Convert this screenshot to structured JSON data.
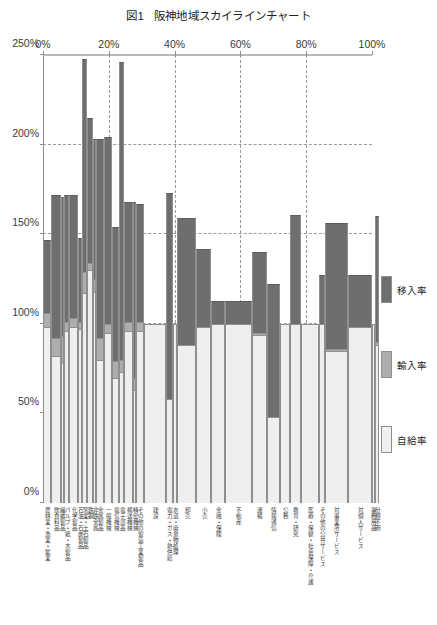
{
  "figure": {
    "number": "図1",
    "title": "阪神地域スカイラインチャート"
  },
  "legend": {
    "position": "right",
    "items": [
      {
        "key": "transfer",
        "label": "移入率",
        "color": "#6e6e6e"
      },
      {
        "key": "import",
        "label": "輸入率",
        "color": "#adadad"
      },
      {
        "key": "self",
        "label": "自給率",
        "color": "#efefef"
      }
    ]
  },
  "axes": {
    "x": {
      "label": "",
      "position": "top",
      "unit": "%",
      "min": 0,
      "max": 100,
      "ticks": [
        0,
        20,
        40,
        60,
        80,
        100
      ],
      "tick_labels": [
        "0%",
        "20%",
        "40%",
        "60%",
        "80%",
        "100%"
      ]
    },
    "y": {
      "label": "",
      "unit": "%",
      "min": 0,
      "max": 250,
      "ticks": [
        0,
        50,
        100,
        150,
        200,
        250
      ],
      "tick_labels": [
        "0%",
        "50%",
        "100%",
        "150%",
        "200%",
        "250%"
      ]
    }
  },
  "chart_data": {
    "type": "bar",
    "variant": "skyline-chart",
    "xlabel": "",
    "ylabel": "",
    "xlim": [
      0,
      100
    ],
    "ylim": [
      0,
      250
    ],
    "grid": true,
    "stacked": true,
    "x_unit": "構成比（%、累積）",
    "y_unit": "率（%）",
    "legend_position": "right",
    "series": [
      {
        "name": "自給率",
        "color": "#efefef"
      },
      {
        "name": "輸入率",
        "color": "#adadad"
      },
      {
        "name": "移入率",
        "color": "#6e6e6e"
      }
    ],
    "categories": [
      "農林業・漁業・鉱業",
      "飲食料品",
      "繊維製品",
      "パルプ・紙・木製品",
      "化学製品",
      "石油・石炭製品",
      "窯業・土石製品",
      "鉄鋼",
      "非鉄金属",
      "金属製品",
      "一般機械",
      "電気機械",
      "電子部品",
      "輸送機械",
      "精密機械",
      "その他の製造工業製品",
      "建設",
      "電力・ガス・熱供給",
      "水道・廃棄物処理",
      "卸売",
      "小売",
      "金融・保険",
      "不動産",
      "運輸",
      "情報通信",
      "公務",
      "教育・研究",
      "医療・保健・社会保障・介護",
      "その他の公共サービス",
      "対事業所サービス",
      "対個人サービス",
      "事務用品",
      "分類不明"
    ],
    "widths_percent": [
      2.4,
      3.0,
      1.0,
      1.6,
      2.7,
      1.3,
      1.4,
      1.8,
      1.0,
      2.2,
      2.7,
      2.0,
      1.6,
      2.7,
      1.0,
      2.4,
      6.6,
      2.0,
      1.4,
      5.8,
      4.4,
      4.4,
      8.0,
      4.6,
      4.0,
      3.0,
      3.4,
      5.4,
      2.0,
      6.8,
      7.4,
      0.8,
      1.4
    ],
    "data": [
      {
        "category": "農林業・漁業・鉱業",
        "self": 98,
        "import": 8,
        "transfer": 41
      },
      {
        "category": "飲食料品",
        "self": 82,
        "import": 10,
        "transfer": 80
      },
      {
        "category": "繊維製品",
        "self": 78,
        "import": 15,
        "transfer": 78
      },
      {
        "category": "パルプ・紙・木製品",
        "self": 96,
        "import": 5,
        "transfer": 71
      },
      {
        "category": "化学製品",
        "self": 98,
        "import": 5,
        "transfer": 69
      },
      {
        "category": "石油・石炭製品",
        "self": 97,
        "import": 4,
        "transfer": 47
      },
      {
        "category": "窯業・土石製品",
        "self": 117,
        "import": 12,
        "transfer": 119
      },
      {
        "category": "鉄鋼",
        "self": 130,
        "import": 4,
        "transfer": 81
      },
      {
        "category": "非鉄金属",
        "self": 118,
        "import": 7,
        "transfer": 78
      },
      {
        "category": "金属製品",
        "self": 80,
        "import": 12,
        "transfer": 111
      },
      {
        "category": "一般機械",
        "self": 95,
        "import": 5,
        "transfer": 104
      },
      {
        "category": "電気機械",
        "self": 70,
        "import": 9,
        "transfer": 75
      },
      {
        "category": "電子部品",
        "self": 73,
        "import": 7,
        "transfer": 166
      },
      {
        "category": "輸送機械",
        "self": 96,
        "import": 5,
        "transfer": 67
      },
      {
        "category": "精密機械",
        "self": 63,
        "import": 7,
        "transfer": 98
      },
      {
        "category": "その他の製造工業製品",
        "self": 96,
        "import": 5,
        "transfer": 66
      },
      {
        "category": "建設",
        "self": 100,
        "import": 0,
        "transfer": 0
      },
      {
        "category": "電力・ガス・熱供給",
        "self": 58,
        "import": 0,
        "transfer": 115
      },
      {
        "category": "水道・廃棄物処理",
        "self": 100,
        "import": 0,
        "transfer": 0
      },
      {
        "category": "卸売",
        "self": 88,
        "import": 0,
        "transfer": 71
      },
      {
        "category": "小売",
        "self": 98,
        "import": 0,
        "transfer": 44
      },
      {
        "category": "金融・保険",
        "self": 100,
        "import": 0,
        "transfer": 13
      },
      {
        "category": "不動産",
        "self": 100,
        "import": 0,
        "transfer": 13
      },
      {
        "category": "運輸",
        "self": 94,
        "import": 1,
        "transfer": 45
      },
      {
        "category": "情報通信",
        "self": 48,
        "import": 0,
        "transfer": 74
      },
      {
        "category": "公務",
        "self": 100,
        "import": 0,
        "transfer": 0
      },
      {
        "category": "教育・研究",
        "self": 100,
        "import": 0,
        "transfer": 61
      },
      {
        "category": "医療・保健・社会保障・介護",
        "self": 100,
        "import": 0,
        "transfer": 0
      },
      {
        "category": "その他の公共サービス",
        "self": 100,
        "import": 0,
        "transfer": 27
      },
      {
        "category": "対事業所サービス",
        "self": 85,
        "import": 1,
        "transfer": 70
      },
      {
        "category": "対個人サービス",
        "self": 98,
        "import": 0,
        "transfer": 29
      },
      {
        "category": "事務用品",
        "self": 100,
        "import": 0,
        "transfer": 0
      },
      {
        "category": "分類不明",
        "self": 88,
        "import": 2,
        "transfer": 70
      }
    ]
  }
}
